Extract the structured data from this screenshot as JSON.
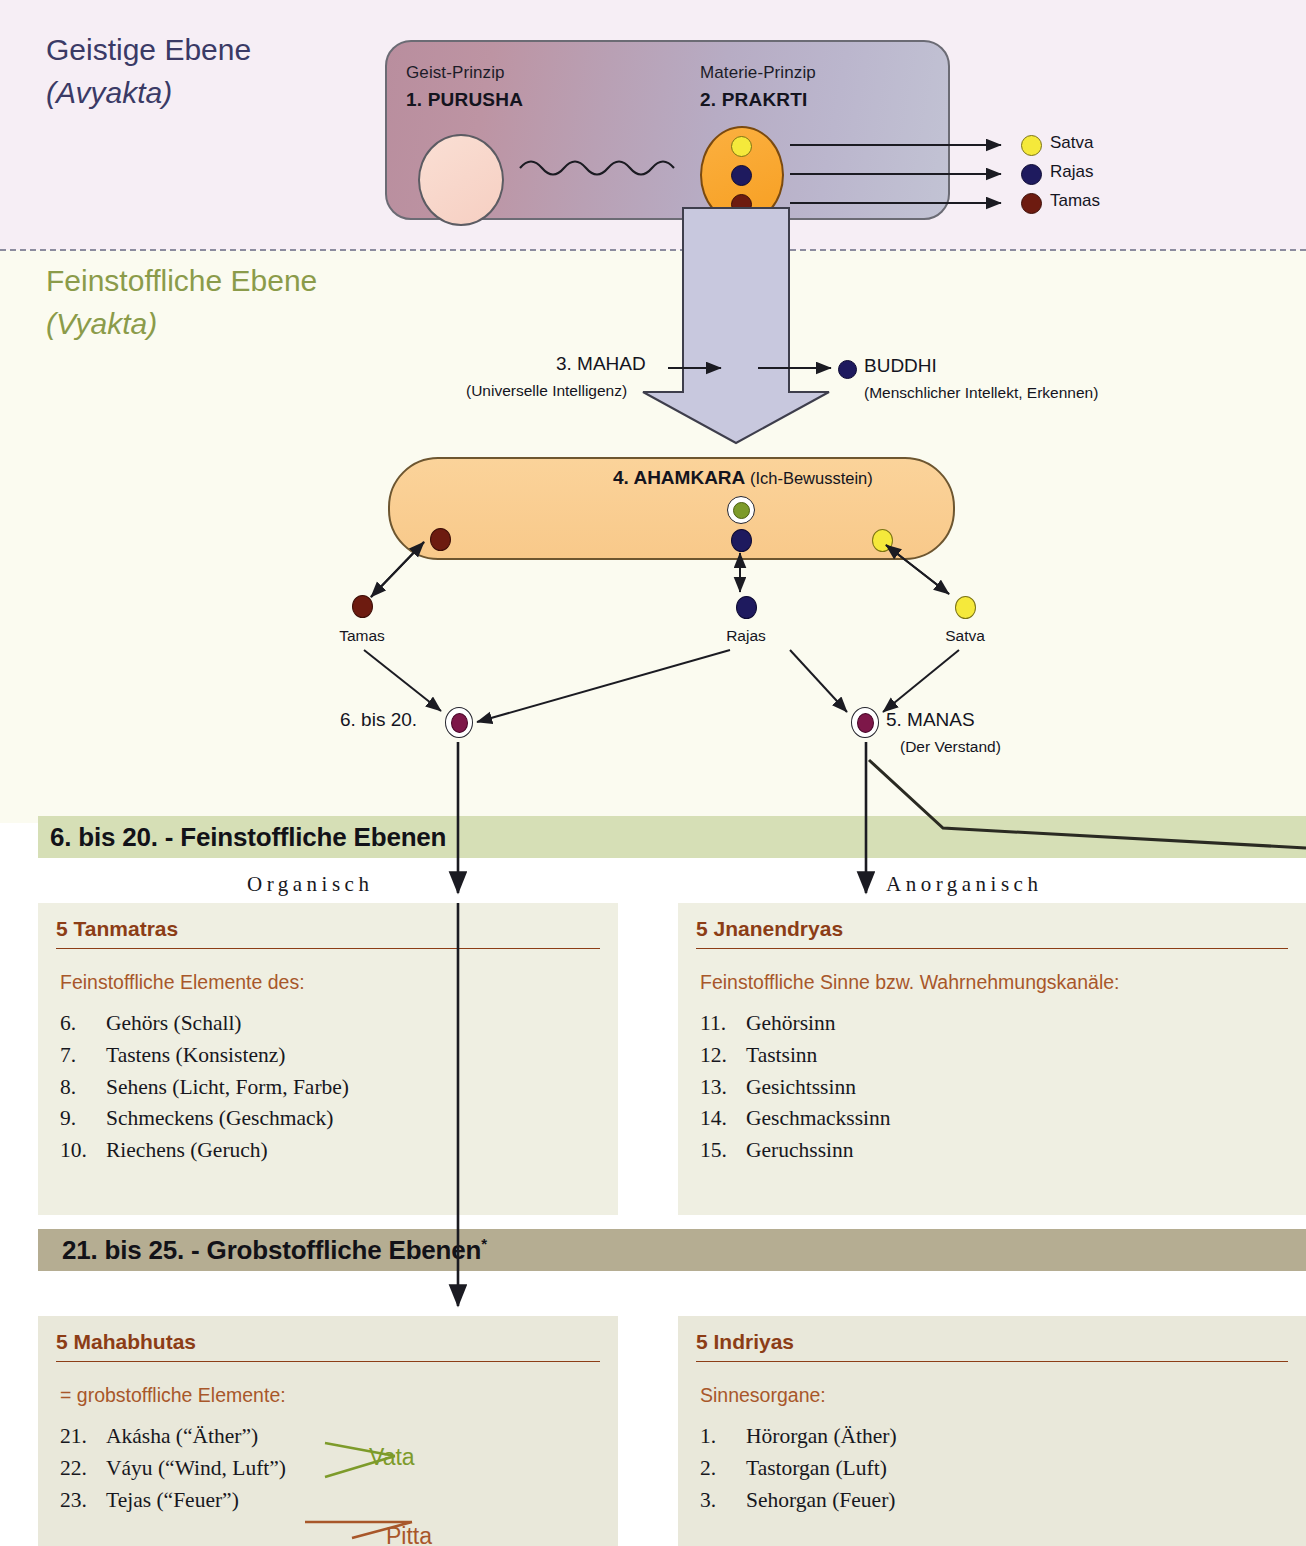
{
  "levels": {
    "avyakta": {
      "title": "Geistige Ebene",
      "subtitle": "(Avyakta)"
    },
    "vyakta": {
      "title": "Feinstoffliche Ebene",
      "subtitle": "(Vyakta)"
    }
  },
  "top_panel": {
    "left": {
      "caption": "Geist-Prinzip",
      "name": "1. PURUSHA"
    },
    "right": {
      "caption": "Materie-Prinzip",
      "name": "2. PRAKRTI"
    }
  },
  "gunas_legend": [
    {
      "label": "Satva",
      "color": "#f5e93b"
    },
    {
      "label": "Rajas",
      "color": "#1e1a5e"
    },
    {
      "label": "Tamas",
      "color": "#6d1b10"
    }
  ],
  "mahad": {
    "name": "3. MAHAD",
    "sub": "(Universelle Intelligenz)",
    "color": "#7d9b2a"
  },
  "buddhi": {
    "name": "BUDDHI",
    "sub": "(Menschlicher Intellekt, Erkennen)",
    "color": "#1e1a5e"
  },
  "ahamkara": {
    "name": "4. AHAMKARA",
    "sub": "(Ich-Bewusstein)",
    "gunas": [
      "Tamas",
      "Rajas",
      "Satva"
    ]
  },
  "nodes": {
    "tanmatra_node": {
      "label": "6. bis 20.",
      "color": "#7d1749"
    },
    "manas": {
      "label": "5. MANAS",
      "sub": "(Der Verstand)",
      "color": "#7d1749"
    }
  },
  "sections": {
    "subtle": {
      "title": "6. bis 20. - Feinstoffliche Ebenen",
      "band_color": "#d6dfb6"
    },
    "gross": {
      "title": "21. bis 25. - Grobstoffliche Ebenen",
      "marker": "*",
      "band_color": "#b5ad92"
    }
  },
  "column_labels": {
    "left": "Organisch",
    "right": "Anorganisch"
  },
  "boxes": {
    "tanmatras": {
      "title": "5 Tanmatras",
      "lead": "Feinstoffliche Elemente des:",
      "items": [
        {
          "num": "6.",
          "text": "Gehörs (Schall)"
        },
        {
          "num": "7.",
          "text": "Tastens (Konsistenz)"
        },
        {
          "num": "8.",
          "text": "Sehens (Licht, Form, Farbe)"
        },
        {
          "num": "9.",
          "text": "Schmeckens (Geschmack)"
        },
        {
          "num": "10.",
          "text": "Riechens (Geruch)"
        }
      ]
    },
    "jnanendryas": {
      "title": "5 Jnanendryas",
      "lead": "Feinstoffliche Sinne bzw. Wahrnehmungskanäle:",
      "items": [
        {
          "num": "11.",
          "text": "Gehörsinn"
        },
        {
          "num": "12.",
          "text": "Tastsinn"
        },
        {
          "num": "13.",
          "text": "Gesichtssinn"
        },
        {
          "num": "14.",
          "text": "Geschmackssinn"
        },
        {
          "num": "15.",
          "text": "Geruchssinn"
        }
      ]
    },
    "mahabhutas": {
      "title": "5 Mahabhutas",
      "lead": "= grobstoffliche Elemente:",
      "items": [
        {
          "num": "21.",
          "text": "Akásha (“Äther”)"
        },
        {
          "num": "22.",
          "text": "Váyu (“Wind, Luft”)"
        },
        {
          "num": "23.",
          "text": "Tejas (“Feuer”)"
        }
      ],
      "doshas": [
        {
          "label": "Vata",
          "color": "#7d9b2a"
        },
        {
          "label": "Pitta",
          "color": "#a8572a"
        }
      ]
    },
    "indriyas": {
      "title": "5 Indriyas",
      "lead": "Sinnesorgane:",
      "items": [
        {
          "num": "1.",
          "text": "Hörorgan (Äther)"
        },
        {
          "num": "2.",
          "text": "Tastorgan (Luft)"
        },
        {
          "num": "3.",
          "text": "Sehorgan (Feuer)"
        }
      ]
    }
  }
}
